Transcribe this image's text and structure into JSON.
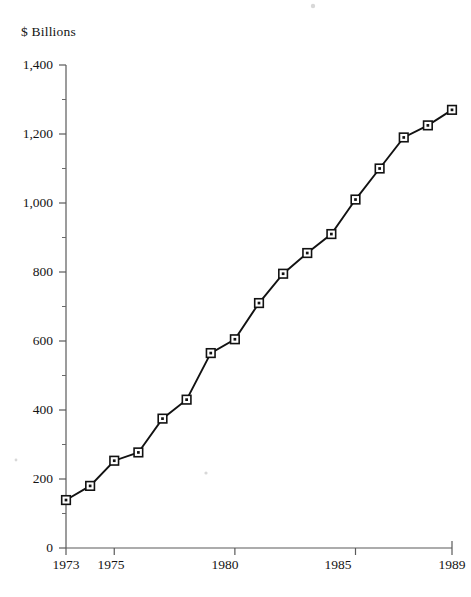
{
  "chart_data": {
    "type": "line",
    "title": "",
    "subtitle": "",
    "xlabel": "",
    "ylabel": "$ Billions",
    "ylabel_position": "top-left",
    "grid": false,
    "legend": null,
    "marker": "square-with-center-dot",
    "xlim": [
      1973,
      1989
    ],
    "ylim": [
      0,
      1400
    ],
    "y_tick_labels": [
      "1,400",
      "1,200",
      "1,000",
      "800",
      "600",
      "400",
      "200",
      "0"
    ],
    "y_tick_values": [
      1400,
      1200,
      1000,
      800,
      600,
      400,
      200,
      0
    ],
    "y_minor_tick_values": [
      1300,
      1100,
      900,
      700,
      500,
      300,
      100
    ],
    "x_tick_labels": [
      "1973",
      "1975",
      "1980",
      "1985",
      "1989"
    ],
    "x_tick_values": [
      1973,
      1975,
      1980,
      1985,
      1989
    ],
    "x": [
      1973,
      1974,
      1975,
      1976,
      1977,
      1978,
      1979,
      1980,
      1981,
      1982,
      1983,
      1984,
      1985,
      1986,
      1987,
      1988,
      1989
    ],
    "values": [
      139,
      180,
      253,
      277,
      375,
      430,
      565,
      605,
      710,
      795,
      855,
      910,
      1010,
      1100,
      1190,
      1225,
      1270
    ],
    "series": [
      {
        "name": "",
        "values": [
          139,
          180,
          253,
          277,
          375,
          430,
          565,
          605,
          710,
          795,
          855,
          910,
          1010,
          1100,
          1190,
          1225,
          1270
        ]
      }
    ],
    "colors": {
      "line": "#121212",
      "marker_fill": "#ffffff",
      "marker_stroke": "#121212",
      "axis": "#5a5a5a",
      "background": "#ffffff",
      "text": "#141414"
    }
  }
}
